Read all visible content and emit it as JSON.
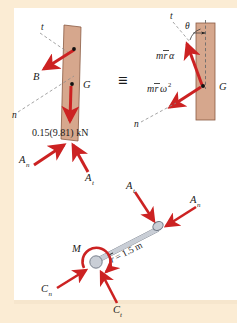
{
  "figure": {
    "equivalence_symbol": "≡",
    "colors": {
      "page_border": "#fbecd4",
      "plate": "#ffffff",
      "bar_fill": "#d6a78d",
      "bar_stroke": "#8a5a43",
      "arrow_red": "#cc2222",
      "link_fill": "#c9ced6",
      "link_stroke": "#6d7582",
      "axis_dash": "#8d8d8d",
      "label_text": "#1a1a1a"
    }
  },
  "free_body_diagram": {
    "name": "free-body-diagram",
    "bar_label_center_of_mass": "G",
    "axis_t_label": "t",
    "axis_n_label": "n",
    "force_B_label": "B",
    "weight_label": "0.15(9.81) kN",
    "reaction_normal_label": "A",
    "reaction_normal_sub": "n",
    "reaction_tangential_label": "A",
    "reaction_tangential_sub": "t"
  },
  "kinetic_diagram": {
    "name": "kinetic-diagram",
    "bar_label_center_of_mass": "G",
    "axis_t_label": "t",
    "axis_n_label": "n",
    "angle_label": "θ",
    "tangential_term": {
      "mass": "m",
      "radius": "r",
      "accel": "α"
    },
    "normal_term": {
      "mass": "m",
      "radius": "r",
      "omega": "ω",
      "exponent": "2"
    }
  },
  "link_diagram": {
    "name": "link-free-body-diagram",
    "length_label": "r",
    "length_value": " = 1.5 m",
    "moment_label": "M",
    "force_A_normal_label": "A",
    "force_A_normal_sub": "n",
    "force_A_tangential_label": "A",
    "force_A_tangential_sub": "t",
    "force_C_normal_label": "C",
    "force_C_normal_sub": "n",
    "force_C_tangential_label": "C",
    "force_C_tangential_sub": "t"
  }
}
